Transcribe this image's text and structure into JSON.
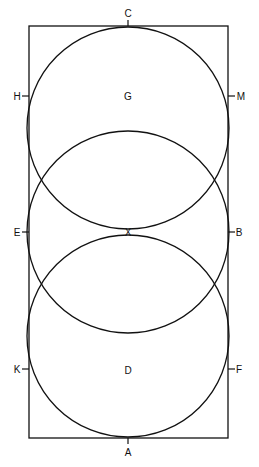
{
  "diagram": {
    "colors": {
      "line": "#111111",
      "background": "#ffffff",
      "text": "#111111"
    },
    "rectangle": {
      "x": 29,
      "y": 26,
      "width": 199,
      "height": 412
    },
    "circles": [
      {
        "name": "top-circle",
        "cx": 128,
        "cy": 128,
        "r": 101
      },
      {
        "name": "middle-circle",
        "cx": 128,
        "cy": 232,
        "r": 101
      },
      {
        "name": "bottom-circle",
        "cx": 128,
        "cy": 336,
        "r": 101
      }
    ],
    "labels": {
      "C": "C",
      "H": "H",
      "G": "G",
      "M": "M",
      "E": "E",
      "X": "X",
      "B": "B",
      "K": "K",
      "D": "D",
      "F": "F",
      "A": "A"
    }
  }
}
